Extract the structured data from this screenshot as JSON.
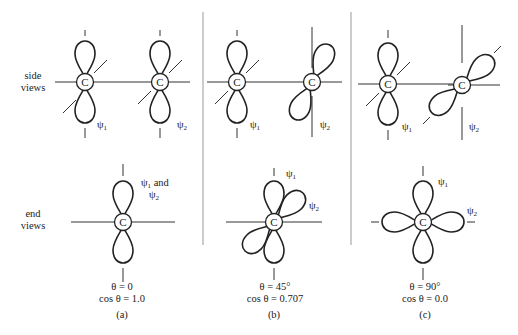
{
  "figure": {
    "row_labels": {
      "side": [
        "side",
        "views"
      ],
      "end": [
        "end",
        "views"
      ]
    },
    "atom_label": "C",
    "psi1": "ψ",
    "psi2": "ψ",
    "sub1": "1",
    "sub2": "2",
    "panels": [
      {
        "id": "a",
        "label": "(a)",
        "theta": "θ = 0",
        "cos": "cos θ = 1.0",
        "end_label_line1": "ψ₁ and",
        "end_label_line2": "ψ₂",
        "rotation_deg": 0
      },
      {
        "id": "b",
        "label": "(b)",
        "theta": "θ = 45°",
        "cos": "cos θ = 0.707",
        "rotation_deg": 45
      },
      {
        "id": "c",
        "label": "(c)",
        "theta": "θ = 90°",
        "cos": "cos θ = 0.0",
        "rotation_deg": 90
      }
    ],
    "colors": {
      "ink": "#222222",
      "divider": "#999999",
      "background": "#ffffff"
    }
  }
}
